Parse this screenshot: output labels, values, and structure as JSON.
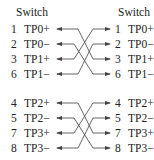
{
  "diagram": {
    "left_title": "Switch",
    "right_title": "Switch",
    "left_pins": [
      {
        "num": "1",
        "name": "TP0+"
      },
      {
        "num": "2",
        "name": "TP0−"
      },
      {
        "num": "3",
        "name": "TP1+"
      },
      {
        "num": "6",
        "name": "TP1−"
      },
      {
        "num": "4",
        "name": "TP2+"
      },
      {
        "num": "5",
        "name": "TP2−"
      },
      {
        "num": "7",
        "name": "TP3+"
      },
      {
        "num": "8",
        "name": "TP3−"
      }
    ],
    "right_pins": [
      {
        "num": "1",
        "name": "TP0+"
      },
      {
        "num": "2",
        "name": "TP0−"
      },
      {
        "num": "3",
        "name": "TP1+"
      },
      {
        "num": "6",
        "name": "TP1−"
      },
      {
        "num": "4",
        "name": "TP2+"
      },
      {
        "num": "5",
        "name": "TP2−"
      },
      {
        "num": "7",
        "name": "TP3+"
      },
      {
        "num": "8",
        "name": "TP3−"
      }
    ],
    "connections": [
      {
        "from": "left TP0+",
        "to": "right TP1+"
      },
      {
        "from": "left TP0−",
        "to": "right TP1−"
      },
      {
        "from": "left TP1+",
        "to": "right TP0+"
      },
      {
        "from": "left TP1−",
        "to": "right TP0−"
      },
      {
        "from": "left TP2+",
        "to": "right TP3+"
      },
      {
        "from": "left TP2−",
        "to": "right TP3−"
      },
      {
        "from": "left TP3+",
        "to": "right TP2+"
      },
      {
        "from": "left TP3−",
        "to": "right TP2−"
      }
    ],
    "line_color": "#444444"
  }
}
